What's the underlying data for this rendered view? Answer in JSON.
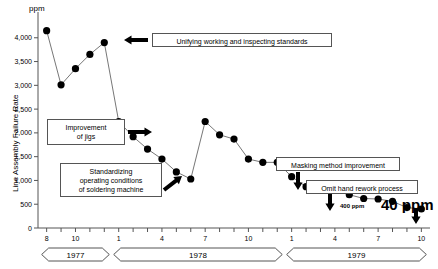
{
  "chart_data": {
    "type": "line",
    "title": "",
    "ylabel": "Line Assembly Failure Rate",
    "yunit": "ppm",
    "xlabel": "",
    "ylim": [
      0,
      4500
    ],
    "yticks": [
      0,
      500,
      1000,
      1500,
      2000,
      2500,
      3000,
      3500,
      4000
    ],
    "ytick_labels": [
      "0",
      "500",
      "1,000",
      "1,500",
      "2,000",
      "2,500",
      "3,000",
      "3,500",
      "4,000"
    ],
    "grid": false,
    "legend": "none",
    "x_tick_labels": [
      "8",
      "10",
      "1",
      "4",
      "7",
      "10",
      "1",
      "4",
      "7",
      "10"
    ],
    "x_tick_months": [
      8,
      10,
      13,
      16,
      19,
      22,
      25,
      28,
      31,
      34
    ],
    "x_range": [
      7.4,
      34.6
    ],
    "year_bands": [
      {
        "label": "1977",
        "start": 8,
        "end": 12
      },
      {
        "label": "1978",
        "start": 13,
        "end": 24
      },
      {
        "label": "1979",
        "start": 25,
        "end": 34
      }
    ],
    "x": [
      8,
      9,
      10,
      11,
      12,
      13,
      14,
      15,
      16,
      17,
      18,
      19,
      20,
      21,
      22,
      23,
      24,
      25,
      26,
      27,
      28,
      29,
      30,
      31,
      32,
      33,
      34
    ],
    "values": [
      4150,
      3010,
      3350,
      3650,
      3900,
      2240,
      1920,
      1660,
      1450,
      1180,
      1030,
      2240,
      1960,
      1870,
      1450,
      1380,
      1380,
      1080,
      870,
      840,
      840,
      700,
      620,
      610,
      560,
      430,
      400
    ],
    "point_labels": [
      {
        "x": 31,
        "value": 400,
        "text": "400 ppm"
      },
      {
        "x": 34,
        "value": 40,
        "text": "40 ppm"
      }
    ]
  },
  "annotations": [
    {
      "id": "unifying",
      "text": "Unifying working and inspecting standards"
    },
    {
      "id": "jigs",
      "text": "Improvement\nof jigs"
    },
    {
      "id": "soldering",
      "text": "Standardizing\noperating conditions\nof soldering machine"
    },
    {
      "id": "masking",
      "text": "Masking method improvement"
    },
    {
      "id": "rework",
      "text": "Omit hand rework process"
    }
  ],
  "labels": {
    "jigs_l1": "Improvement",
    "jigs_l2": "of jigs",
    "sold_l1": "Standardizing",
    "sold_l2": "operating conditions",
    "sold_l3": "of soldering machine",
    "unifying": "Unifying working and inspecting standards",
    "masking": "Masking method improvement",
    "rework": "Omit hand rework process",
    "ppm_unit": "ppm",
    "yaxis_title": "Line Assembly Failure Rate",
    "label_400": "400 ppm",
    "label_40": "40 ppm"
  },
  "colors": {
    "ink": "#000000",
    "axis": "#555555",
    "line": "#777777",
    "marker": "#000000",
    "background": "#ffffff"
  }
}
